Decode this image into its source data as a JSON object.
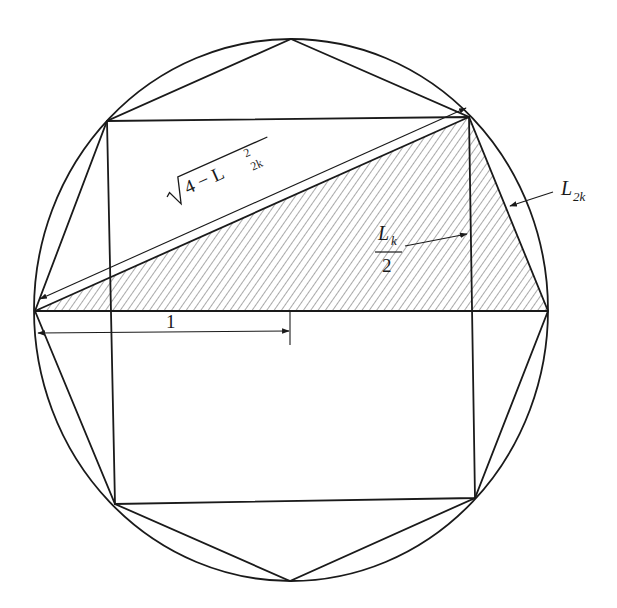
{
  "diagram": {
    "labels": {
      "hypotenuse_radicand_const": "4 − L",
      "hypotenuse_sup": "2",
      "hypotenuse_sub": "2k",
      "half_side_num": "L",
      "half_side_num_sub": "k",
      "half_side_den": "2",
      "side_2k": "L",
      "side_2k_sub": "2k",
      "radius": "1"
    },
    "colors": {
      "stroke": "#1a1a1a",
      "background": "#ffffff",
      "hatch": "#555555"
    }
  }
}
